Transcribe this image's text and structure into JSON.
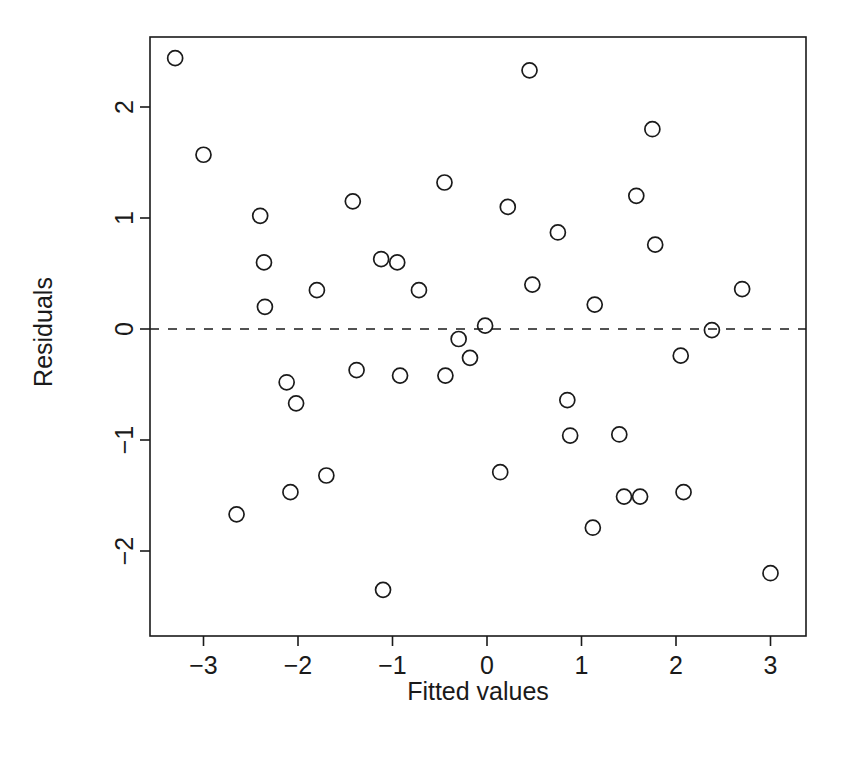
{
  "chart_data": {
    "type": "scatter",
    "title": "",
    "subtitle": "",
    "xlabel": "Fitted values",
    "ylabel": "Residuals",
    "xlim": [
      -3.55,
      3.25
    ],
    "ylim": [
      -2.55,
      2.62
    ],
    "xticks": [
      -3,
      -2,
      -1,
      0,
      1,
      2,
      3
    ],
    "xticklabels": [
      "-3",
      "-2",
      "-1",
      "0",
      "1",
      "2",
      "3"
    ],
    "yticks": [
      -2,
      -1,
      0,
      1,
      2
    ],
    "yticklabels": [
      "-2",
      "-1",
      "0",
      "1",
      "2"
    ],
    "grid": false,
    "legend": null,
    "marker": "open-circle",
    "marker_color": "#1a1a1a",
    "annotations": [
      {
        "name": "zero-reference-line",
        "type": "hline",
        "y": 0,
        "style": "dashed",
        "color": "#1a1a1a"
      }
    ],
    "x": [
      -3.3,
      -3.0,
      -2.65,
      -2.4,
      -2.35,
      -2.36,
      -2.12,
      -2.08,
      -2.02,
      -1.8,
      -1.7,
      -1.66,
      -1.42,
      -1.38,
      -1.12,
      -1.1,
      -1.06,
      -0.95,
      -0.92,
      -0.72,
      -0.45,
      -0.44,
      -0.3,
      -0.22,
      -0.18,
      -0.02,
      0.14,
      0.22,
      0.45,
      0.48,
      0.52,
      0.75,
      0.85,
      0.88,
      1.12,
      1.14,
      1.18,
      1.4,
      1.45,
      1.58,
      1.62,
      1.75,
      1.78,
      2.05,
      2.08,
      2.1,
      2.38,
      2.7,
      3.0
    ],
    "y": [
      2.44,
      1.57,
      -1.67,
      1.02,
      0.6,
      0.2,
      -0.48,
      -1.47,
      -0.67,
      0.35,
      -1.32,
      -1.32,
      1.15,
      -0.37,
      0.63,
      -2.35,
      0.63,
      0.6,
      -0.42,
      0.35,
      1.32,
      -0.42,
      -0.09,
      -0.42,
      -0.26,
      0.03,
      -1.29,
      1.1,
      2.33,
      0.4,
      1.1,
      0.87,
      -0.64,
      -0.96,
      -1.79,
      0.22,
      -0.96,
      -0.95,
      -1.51,
      1.2,
      -1.51,
      1.8,
      0.76,
      -0.24,
      -1.47,
      -0.24,
      -0.01,
      0.36,
      -2.2
    ],
    "n_points": 49,
    "points": [
      {
        "x": -3.3,
        "y": 2.44
      },
      {
        "x": -3.0,
        "y": 1.57
      },
      {
        "x": -2.65,
        "y": -1.67
      },
      {
        "x": -2.4,
        "y": 1.02
      },
      {
        "x": -2.36,
        "y": 0.6
      },
      {
        "x": -2.35,
        "y": 0.2
      },
      {
        "x": -2.12,
        "y": -0.48
      },
      {
        "x": -2.08,
        "y": -1.47
      },
      {
        "x": -2.02,
        "y": -0.67
      },
      {
        "x": -1.8,
        "y": 0.35
      },
      {
        "x": -1.7,
        "y": -1.32
      },
      {
        "x": -1.42,
        "y": 1.15
      },
      {
        "x": -1.38,
        "y": -0.37
      },
      {
        "x": -1.12,
        "y": 0.63
      },
      {
        "x": -1.1,
        "y": -2.35
      },
      {
        "x": -0.95,
        "y": 0.6
      },
      {
        "x": -0.92,
        "y": -0.42
      },
      {
        "x": -0.72,
        "y": 0.35
      },
      {
        "x": -0.45,
        "y": 1.32
      },
      {
        "x": -0.44,
        "y": -0.42
      },
      {
        "x": -0.3,
        "y": -0.09
      },
      {
        "x": -0.18,
        "y": -0.26
      },
      {
        "x": -0.02,
        "y": 0.03
      },
      {
        "x": 0.14,
        "y": -1.29
      },
      {
        "x": 0.22,
        "y": 1.1
      },
      {
        "x": 0.45,
        "y": 2.33
      },
      {
        "x": 0.48,
        "y": 0.4
      },
      {
        "x": 0.75,
        "y": 0.87
      },
      {
        "x": 0.85,
        "y": -0.64
      },
      {
        "x": 0.88,
        "y": -0.96
      },
      {
        "x": 1.12,
        "y": -1.79
      },
      {
        "x": 1.14,
        "y": 0.22
      },
      {
        "x": 1.4,
        "y": -0.95
      },
      {
        "x": 1.45,
        "y": -1.51
      },
      {
        "x": 1.58,
        "y": 1.2
      },
      {
        "x": 1.62,
        "y": -1.51
      },
      {
        "x": 1.75,
        "y": 1.8
      },
      {
        "x": 1.78,
        "y": 0.76
      },
      {
        "x": 2.05,
        "y": -0.24
      },
      {
        "x": 2.08,
        "y": -1.47
      },
      {
        "x": 2.38,
        "y": -0.01
      },
      {
        "x": 2.7,
        "y": 0.36
      },
      {
        "x": 3.0,
        "y": -2.2
      }
    ]
  },
  "geometry": {
    "plot_left": 150,
    "plot_right": 806,
    "plot_top": 37,
    "plot_bottom": 636,
    "x_zero_px": 487,
    "y_zero_px": 329,
    "x_unit_px": 94.5,
    "y_unit_px": 111,
    "marker_radius": 7.5,
    "tick_len": 10
  }
}
